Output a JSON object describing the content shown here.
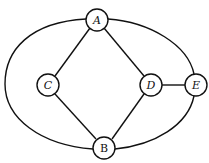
{
  "diagram": {
    "type": "graph",
    "nodes": [
      {
        "id": "A",
        "label": "A",
        "x": 97,
        "y": 20
      },
      {
        "id": "B",
        "label": "B",
        "x": 104,
        "y": 148
      },
      {
        "id": "C",
        "label": "C",
        "x": 48,
        "y": 85
      },
      {
        "id": "D",
        "label": "D",
        "x": 151,
        "y": 85
      },
      {
        "id": "E",
        "label": "E",
        "x": 196,
        "y": 85
      }
    ],
    "edges": [
      {
        "from": "A",
        "to": "C",
        "kind": "straight"
      },
      {
        "from": "A",
        "to": "D",
        "kind": "straight"
      },
      {
        "from": "C",
        "to": "B",
        "kind": "straight"
      },
      {
        "from": "D",
        "to": "B",
        "kind": "straight"
      },
      {
        "from": "D",
        "to": "E",
        "kind": "straight"
      },
      {
        "from": "A",
        "to": "B",
        "kind": "outer-left-arc"
      },
      {
        "from": "A",
        "to": "E",
        "kind": "outer-top-right-arc"
      },
      {
        "from": "E",
        "to": "B",
        "kind": "outer-bottom-right-arc"
      }
    ]
  }
}
